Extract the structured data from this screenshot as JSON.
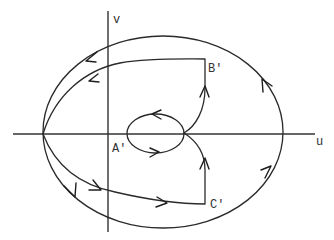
{
  "figure": {
    "type": "phase-plane diagram",
    "axes": {
      "horizontal": {
        "label": "u"
      },
      "vertical": {
        "label": "v"
      }
    },
    "points": [
      {
        "id": "A",
        "label": "A'"
      },
      {
        "id": "B",
        "label": "B'"
      },
      {
        "id": "C",
        "label": "C'"
      }
    ],
    "trajectories": [
      {
        "name": "outer-ellipse",
        "direction": "counterclockwise",
        "arrow_count": 4
      },
      {
        "name": "inner-loop",
        "direction": "counterclockwise",
        "arrow_count": 2
      },
      {
        "name": "upper-branch-via-B",
        "direction": "from loop up to B' then left to left vertex",
        "arrow_count": 2
      },
      {
        "name": "lower-branch-via-C",
        "direction": "from left vertex right to C' then up to loop",
        "arrow_count": 3
      }
    ],
    "colors": {
      "stroke": "#2a2a2a",
      "background": "#ffffff"
    }
  }
}
